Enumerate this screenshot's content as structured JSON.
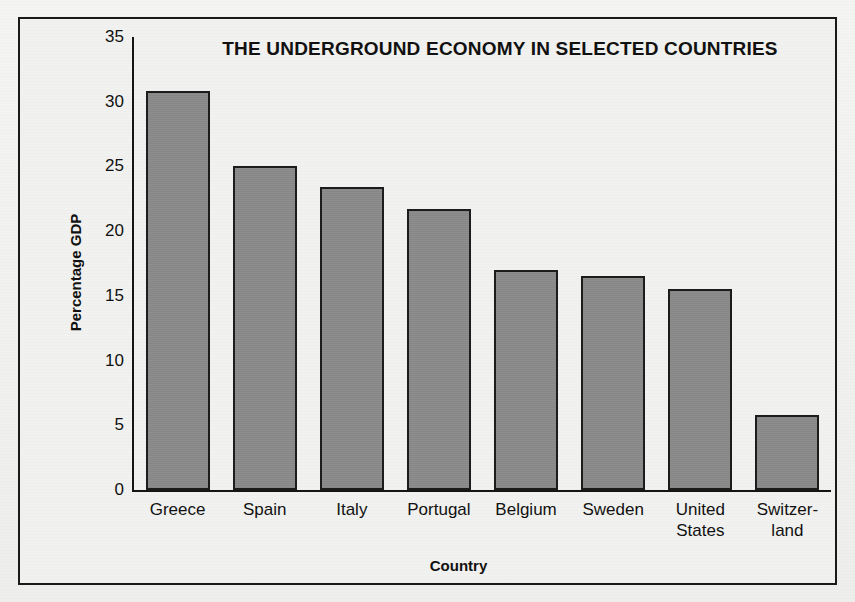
{
  "chart_data": {
    "type": "bar",
    "title": "THE UNDERGROUND ECONOMY IN SELECTED COUNTRIES",
    "xlabel": "Country",
    "ylabel": "Percentage GDP",
    "categories": [
      "Greece",
      "Spain",
      "Italy",
      "Portugal",
      "Belgium",
      "Sweden",
      "United States",
      "Switzerland"
    ],
    "category_labels": [
      [
        "Greece"
      ],
      [
        "Spain"
      ],
      [
        "Italy"
      ],
      [
        "Portugal"
      ],
      [
        "Belgium"
      ],
      [
        "Sweden"
      ],
      [
        "United",
        "States"
      ],
      [
        "Switzer-",
        "land"
      ]
    ],
    "values": [
      30.8,
      25.0,
      23.4,
      21.7,
      17.0,
      16.5,
      15.5,
      5.8
    ],
    "ylim": [
      0,
      35
    ],
    "yticks": [
      0,
      5,
      10,
      15,
      20,
      25,
      30,
      35
    ],
    "ytick_labels": [
      "0",
      "5",
      "10",
      "15",
      "20",
      "25",
      "30",
      "35"
    ],
    "grid": false,
    "legend": false,
    "bar_color": "#8c8c8c",
    "bar_edge_color": "#1c1c1c",
    "frame_color": "#1a1a1a",
    "background_color": "#f1f1ef"
  }
}
